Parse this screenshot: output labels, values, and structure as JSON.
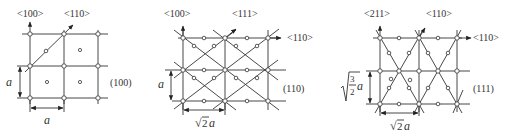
{
  "figure": {
    "panels": [
      {
        "plane": "(100)",
        "directions": [
          "<100>",
          "<110>"
        ],
        "dim_horizontal": "a",
        "dim_vertical": "a"
      },
      {
        "plane": "(110)",
        "directions": [
          "<100>",
          "<111>",
          "<110>"
        ],
        "dim_horizontal_root": "√",
        "dim_horizontal_num": "2",
        "dim_horizontal_var": "a",
        "dim_vertical": "a"
      },
      {
        "plane": "(111)",
        "directions": [
          "<211>",
          "<110>",
          "<110>"
        ],
        "dim_horizontal_root": "√",
        "dim_horizontal_num": "2",
        "dim_horizontal_var": "a",
        "dim_vertical_num": "3",
        "dim_vertical_den": "2",
        "dim_vertical_var": "a"
      }
    ]
  }
}
